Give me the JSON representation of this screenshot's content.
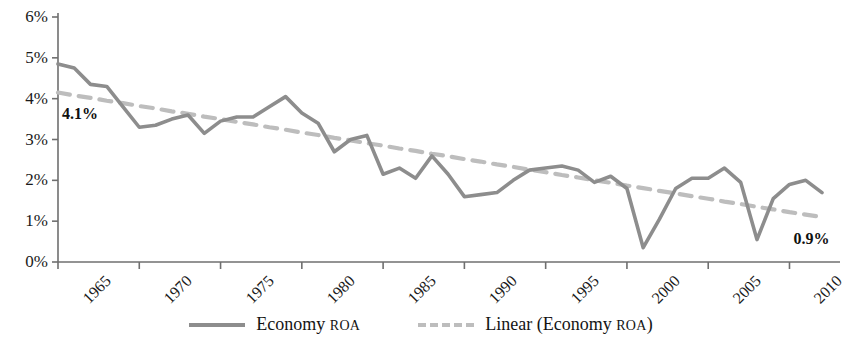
{
  "chart_data": {
    "type": "line",
    "title": "",
    "xlabel": "",
    "ylabel": "",
    "xlim": [
      1965,
      2012
    ],
    "ylim": [
      0,
      6
    ],
    "yunit": "%",
    "grid": false,
    "legend_position": "bottom",
    "ytick_labels": [
      "0%",
      "1%",
      "2%",
      "3%",
      "4%",
      "5%",
      "6%"
    ],
    "ytick_values": [
      0,
      1,
      2,
      3,
      4,
      5,
      6
    ],
    "xtick_labels": [
      "1965",
      "1970",
      "1975",
      "1980",
      "1985",
      "1990",
      "1995",
      "2000",
      "2005",
      "2010"
    ],
    "xtick_values": [
      1965,
      1970,
      1975,
      1980,
      1985,
      1990,
      1995,
      2000,
      2005,
      2010
    ],
    "x": [
      1965,
      1966,
      1967,
      1968,
      1969,
      1970,
      1971,
      1972,
      1973,
      1974,
      1975,
      1976,
      1977,
      1978,
      1979,
      1980,
      1981,
      1982,
      1983,
      1984,
      1985,
      1986,
      1987,
      1988,
      1989,
      1990,
      1991,
      1992,
      1993,
      1994,
      1995,
      1996,
      1997,
      1998,
      1999,
      2000,
      2001,
      2002,
      2003,
      2004,
      2005,
      2006,
      2007,
      2008,
      2009,
      2010,
      2011,
      2012
    ],
    "series": [
      {
        "name": "Economy ROA",
        "color": "#8d8d8d",
        "style": "solid",
        "values": [
          4.85,
          4.75,
          4.35,
          4.3,
          3.8,
          3.3,
          3.35,
          3.5,
          3.6,
          3.15,
          3.45,
          3.55,
          3.55,
          3.8,
          4.05,
          3.65,
          3.4,
          2.7,
          3.0,
          3.1,
          2.15,
          2.3,
          2.05,
          2.6,
          2.15,
          1.6,
          1.65,
          1.7,
          2.0,
          2.25,
          2.3,
          2.35,
          2.25,
          1.95,
          2.1,
          1.8,
          0.35,
          1.05,
          1.8,
          2.05,
          2.05,
          2.3,
          1.95,
          0.55,
          1.55,
          1.9,
          2.0,
          1.7
        ]
      },
      {
        "name": "Linear (Economy ROA)",
        "color": "#bdbdbd",
        "style": "dashed",
        "values": [
          4.15,
          4.08,
          4.02,
          3.95,
          3.89,
          3.82,
          3.76,
          3.69,
          3.63,
          3.56,
          3.5,
          3.43,
          3.37,
          3.3,
          3.24,
          3.17,
          3.11,
          3.04,
          2.98,
          2.91,
          2.85,
          2.78,
          2.72,
          2.65,
          2.59,
          2.52,
          2.46,
          2.39,
          2.33,
          2.26,
          2.2,
          2.13,
          2.07,
          2.0,
          1.94,
          1.87,
          1.81,
          1.74,
          1.68,
          1.61,
          1.55,
          1.48,
          1.42,
          1.35,
          1.29,
          1.22,
          1.16,
          1.1
        ]
      }
    ],
    "annotations": [
      {
        "text": "4.1%",
        "x": 1965,
        "y": 3.6,
        "name": "trend-start-value"
      },
      {
        "text": "0.9%",
        "x": 2010,
        "y": 0.55,
        "name": "trend-end-value"
      }
    ],
    "legend": [
      {
        "label": "Economy ",
        "small_caps": "ROA",
        "style": "solid",
        "color": "#8d8d8d"
      },
      {
        "label": "Linear (Economy ",
        "small_caps": "ROA",
        "suffix": ")",
        "style": "dashed",
        "color": "#bdbdbd"
      }
    ]
  },
  "axis": {
    "line_color": "#6f6f6f"
  }
}
